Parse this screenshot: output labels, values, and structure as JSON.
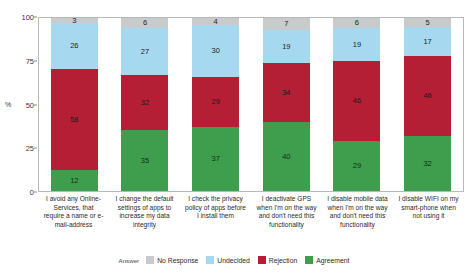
{
  "chart_data": {
    "type": "bar",
    "subtype": "stacked-bar-100-percent",
    "title": "",
    "xlabel": "",
    "ylabel": "%",
    "ylim": [
      0,
      100
    ],
    "yticks": [
      0,
      25,
      50,
      75,
      100
    ],
    "grid": false,
    "legend_position": "bottom",
    "legend_title": "Answer",
    "categories": [
      "I avoid any Online-Services, that require a name or e-mail-address",
      "I change the default settings of apps to increase my data integrity",
      "I check the privacy policy of apps before I install them",
      "I deactivate GPS when I'm on the way and don't need this functionality",
      "I disable mobile data when I'm on the way and don't need this functionality",
      "I disable WIFI on my smart-phone when not using it"
    ],
    "series": [
      {
        "name": "Agreement",
        "color": "#3f9e4d",
        "values": [
          12,
          35,
          37,
          40,
          29,
          32
        ]
      },
      {
        "name": "Rejection",
        "color": "#b51f35",
        "values": [
          58,
          32,
          29,
          34,
          46,
          46
        ]
      },
      {
        "name": "Undecided",
        "color": "#a6d8f0",
        "values": [
          26,
          27,
          30,
          19,
          19,
          17
        ]
      },
      {
        "name": "No Response",
        "color": "#c8cacb",
        "values": [
          3,
          6,
          4,
          7,
          6,
          5
        ]
      }
    ],
    "stack_order_bottom_to_top": [
      "Agreement",
      "Rejection",
      "Undecided",
      "No Response"
    ]
  },
  "axis": {
    "y_title": "%",
    "y_ticks": [
      "0",
      "25",
      "50",
      "75",
      "100"
    ]
  },
  "legend": {
    "title": "Answer",
    "items": [
      {
        "label": "No Response",
        "color": "#c8cacb"
      },
      {
        "label": "Undecided",
        "color": "#a6d8f0"
      },
      {
        "label": "Rejection",
        "color": "#b51f35"
      },
      {
        "label": "Agreement",
        "color": "#3f9e4d"
      }
    ]
  }
}
